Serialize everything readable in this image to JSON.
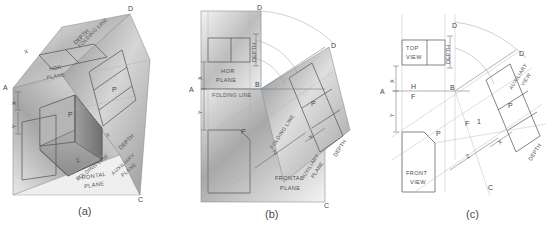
{
  "figure": {
    "background": "#ffffff",
    "line_color": "#6e7175",
    "panels": [
      {
        "key": "a",
        "caption": "(a)",
        "description": "Pictorial of the glass box with horizontal, frontal and auxiliary planes folded around the object",
        "plane_labels": [
          "HOR PLANE",
          "FRONTAL PLANE",
          "AUXILIARY PLANE"
        ],
        "point_labels": [
          "A",
          "D",
          "C"
        ],
        "feature_labels": [
          "P",
          "P"
        ],
        "dimension_labels": [
          "X",
          "Y",
          "Z",
          "DEPTH",
          "DEPTH"
        ],
        "fold_labels": [
          "FOLDING LINE",
          "FOLDING LINE"
        ]
      },
      {
        "key": "b",
        "caption": "(b)",
        "description": "Projection planes unfolded into a single flat plane",
        "plane_labels": [
          "HOR PLANE",
          "FRONTAL PLANE",
          "AUXILIARY PLANE"
        ],
        "point_labels": [
          "A",
          "B",
          "C",
          "D",
          "D"
        ],
        "feature_labels": [
          "P",
          "P"
        ],
        "dimension_labels": [
          "X",
          "Y",
          "Z",
          "X",
          "DEPTH",
          "DEPTH"
        ],
        "fold_labels": [
          "FOLDING LINE",
          "FOLDING LINE"
        ]
      },
      {
        "key": "c",
        "caption": "(c)",
        "description": "Resulting orthographic top, front and auxiliary views with reference line notation",
        "view_labels": [
          "TOP VIEW",
          "FRONT VIEW",
          "AUXILIARY VIEW"
        ],
        "point_labels": [
          "A",
          "B",
          "C",
          "D",
          "D"
        ],
        "reference_labels": [
          "H",
          "F",
          "F",
          "1"
        ],
        "feature_labels": [
          "P",
          "P"
        ],
        "dimension_labels": [
          "X",
          "Y",
          "Z",
          "X",
          "DEPTH",
          "DEPTH"
        ]
      }
    ]
  },
  "panel_a": {
    "caption": "(a)",
    "hor_plane_line1": "HOR",
    "hor_plane_line2": "PLANE",
    "frontal_plane_line1": "FRONTAL",
    "frontal_plane_line2": "PLANE",
    "aux_plane_line1": "AUXILIARY",
    "aux_plane_line2": "PLANE",
    "pt_a": "A",
    "pt_d": "D",
    "pt_c": "C",
    "feat_p_top": "P",
    "feat_p_aux": "P",
    "dim_x": "X",
    "dim_y": "Y",
    "dim_z": "Z",
    "dim_depth_top": "DEPTH",
    "dim_depth_aux": "DEPTH",
    "fold_line_1": "FOLDING LINE",
    "fold_line_2": "FOLDING LINE"
  },
  "panel_b": {
    "caption": "(b)",
    "hor_plane_line1": "HOR",
    "hor_plane_line2": "PLANE",
    "frontal_plane_line1": "FRONTAL",
    "frontal_plane_line2": "PLANE",
    "aux_plane_line1": "AUXILIARY",
    "aux_plane_line2": "PLANE",
    "pt_a": "A",
    "pt_b": "B",
    "pt_c": "C",
    "pt_d_top": "D",
    "pt_d_right": "D",
    "feat_p_front": "P",
    "feat_p_aux": "P",
    "dim_x_left": "X",
    "dim_y_left": "Y",
    "dim_z": "Z",
    "dim_x_aux": "X",
    "dim_depth_top": "DEPTH",
    "dim_depth_aux": "DEPTH",
    "fold_line_h": "FOLDING LINE",
    "fold_line_aux": "FOLDING LINE"
  },
  "panel_c": {
    "caption": "(c)",
    "top_view_line1": "TOP",
    "top_view_line2": "VIEW",
    "front_view_line1": "FRONT",
    "front_view_line2": "VIEW",
    "aux_view_line1": "AUXILIARY",
    "aux_view_line2": "VIEW",
    "pt_a": "A",
    "pt_b": "B",
    "pt_c": "C",
    "pt_d_top": "D",
    "pt_d_right": "D",
    "ref_h": "H",
    "ref_f_left": "F",
    "ref_f_mid": "F",
    "ref_1": "1",
    "feat_p_front": "P",
    "feat_p_aux": "P",
    "dim_x_left": "X",
    "dim_y_left": "Y",
    "dim_z": "Z",
    "dim_x_aux": "X",
    "dim_depth_top": "DEPTH",
    "dim_depth_aux": "DEPTH"
  }
}
